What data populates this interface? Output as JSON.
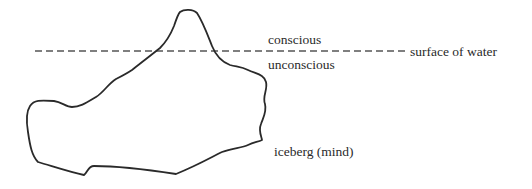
{
  "diagram": {
    "type": "labeled illustration",
    "labels": {
      "above_line": "conscious",
      "below_line": "unconscious",
      "line_label": "surface of water",
      "shape_label": "iceberg (mind)"
    },
    "colors": {
      "outline": "#2a2a2a",
      "water_line": "#555555",
      "text": "#2a2a2a",
      "background": "#ffffff"
    }
  }
}
